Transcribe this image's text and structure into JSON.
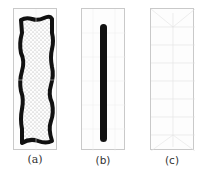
{
  "figure": {
    "panels": [
      {
        "id": "a",
        "label": "(a)",
        "description": "dotted region enclosed by thick wavy black border"
      },
      {
        "id": "b",
        "label": "(b)",
        "description": "single thick vertical black bar"
      },
      {
        "id": "c",
        "label": "(c)",
        "description": "faint light-gray mesh, nearly empty"
      }
    ]
  },
  "colors": {
    "frame": "#c9c9c9",
    "ink": "#111111",
    "dots": "#9a9a9a",
    "mesh": "#e3e3e3"
  }
}
